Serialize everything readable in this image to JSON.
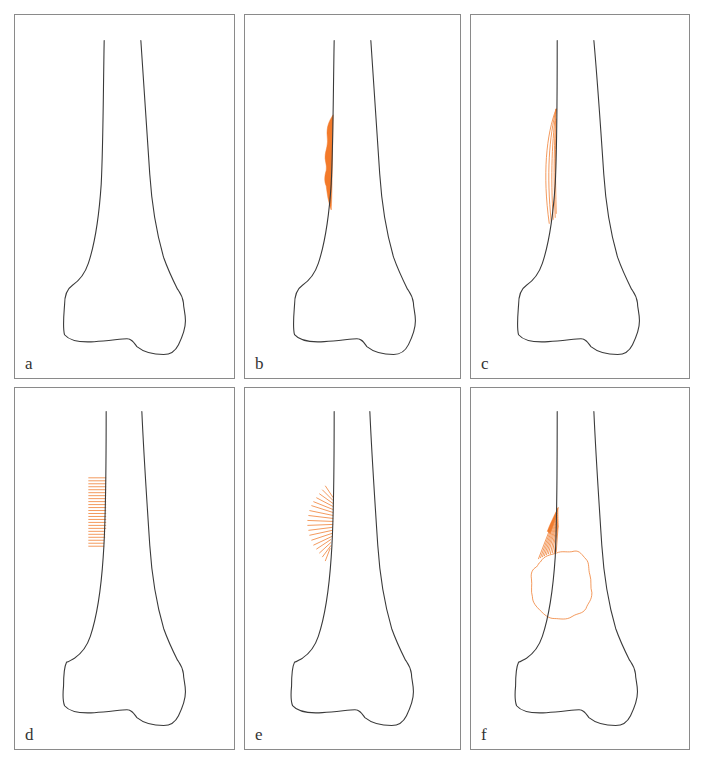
{
  "figure": {
    "accent_color": "#f07f33",
    "outline_color": "#3a3a3a",
    "panels": [
      {
        "id": "a",
        "label": "a",
        "pattern": "normal bone outline"
      },
      {
        "id": "b",
        "label": "b",
        "pattern": "solid periosteal reaction"
      },
      {
        "id": "c",
        "label": "c",
        "pattern": "lamellated (onion-skin) periosteal reaction"
      },
      {
        "id": "d",
        "label": "d",
        "pattern": "perpendicular (hair-on-end) spiculation"
      },
      {
        "id": "e",
        "label": "e",
        "pattern": "sunburst (radiating) spiculation"
      },
      {
        "id": "f",
        "label": "f",
        "pattern": "Codman triangle with soft tissue mass"
      }
    ]
  }
}
